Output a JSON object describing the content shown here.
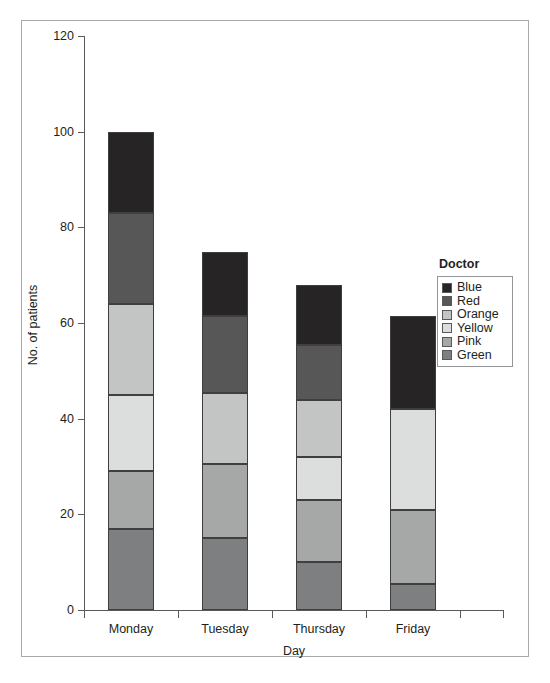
{
  "chart_data": {
    "type": "bar",
    "subtype": "stacked-column",
    "title": "",
    "xlabel": "Day",
    "ylabel": "No. of patients",
    "categories": [
      "Monday",
      "Tuesday",
      "Thursday",
      "Friday"
    ],
    "ylim": [
      0,
      120
    ],
    "yticks": [
      0,
      20,
      40,
      60,
      80,
      100,
      120
    ],
    "ytick_labels": [
      "0",
      "20",
      "40",
      "60",
      "80",
      "100",
      "120"
    ],
    "grid": false,
    "legend_title": "Doctor",
    "legend_position": "right",
    "stack_order_bottom_to_top": [
      "Green",
      "Pink",
      "Yellow",
      "Orange",
      "Red",
      "Blue"
    ],
    "series": [
      {
        "name": "Blue",
        "color": "#272425",
        "values": [
          17,
          13.5,
          12.5,
          19.5
        ]
      },
      {
        "name": "Red",
        "color": "#575757",
        "values": [
          19,
          16,
          11.5,
          0
        ]
      },
      {
        "name": "Orange",
        "color": "#c3c4c4",
        "values": [
          19,
          15,
          12,
          0
        ]
      },
      {
        "name": "Yellow",
        "color": "#dcdddd",
        "values": [
          16,
          0,
          9,
          21
        ]
      },
      {
        "name": "Pink",
        "color": "#a6a8a8",
        "values": [
          12,
          15.5,
          13,
          15.5
        ]
      },
      {
        "name": "Green",
        "color": "#7d7f80",
        "values": [
          17,
          15,
          10,
          5.5
        ]
      }
    ],
    "totals": [
      100,
      75,
      68,
      61.5
    ]
  },
  "legend": {
    "title": "Doctor",
    "items": [
      {
        "label": "Blue"
      },
      {
        "label": "Red"
      },
      {
        "label": "Orange"
      },
      {
        "label": "Yellow"
      },
      {
        "label": "Pink"
      },
      {
        "label": "Green"
      }
    ]
  },
  "caption": {
    "text": ""
  }
}
